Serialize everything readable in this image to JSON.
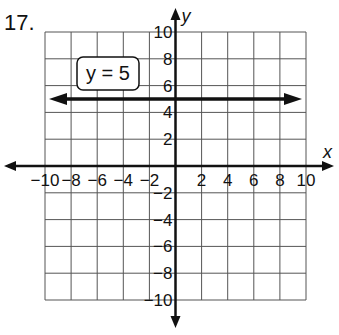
{
  "problem_number": "17.",
  "chart_data": {
    "type": "line",
    "title": "",
    "xlabel": "x",
    "ylabel": "y",
    "xlim": [
      -10,
      10
    ],
    "ylim": [
      -10,
      10
    ],
    "grid": true,
    "x_ticks": [
      "-10",
      "-8",
      "-6",
      "-4",
      "-2",
      "2",
      "4",
      "6",
      "8",
      "10"
    ],
    "y_ticks": [
      "10",
      "8",
      "6",
      "4",
      "2",
      "-2",
      "-4",
      "-6",
      "-8",
      "-10"
    ],
    "series": [
      {
        "name": "y = 5",
        "x": [
          -10,
          10
        ],
        "y": [
          5,
          5
        ],
        "arrows": "both"
      }
    ],
    "annotation": "y = 5"
  }
}
